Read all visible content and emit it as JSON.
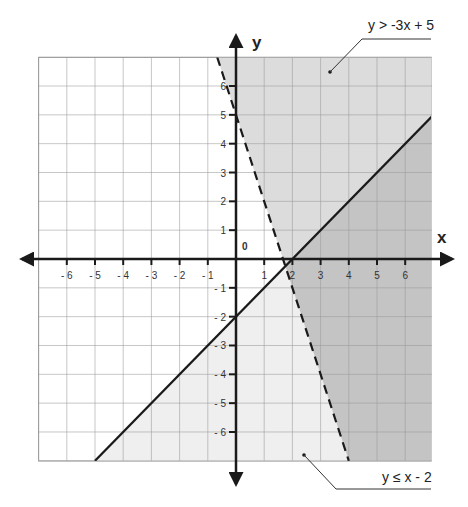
{
  "chart_data": {
    "type": "inequality-graph",
    "title": "",
    "xlabel": "x",
    "ylabel": "y",
    "origin_label": "0",
    "xlim": [
      -7,
      6.95
    ],
    "ylim": [
      -7,
      7
    ],
    "grid": true,
    "x_ticks": [
      -6,
      -5,
      -4,
      -3,
      -2,
      -1,
      1,
      2,
      3,
      4,
      5,
      6
    ],
    "x_tick_labels": [
      "- 6",
      "- 5",
      "- 4",
      "- 3",
      "- 2",
      "- 1",
      "1",
      "2",
      "3",
      "4",
      "5",
      "6"
    ],
    "y_ticks": [
      6,
      5,
      4,
      3,
      2,
      1,
      -1,
      -2,
      -3,
      -4,
      -5,
      -6
    ],
    "y_tick_labels": [
      "6",
      "5",
      "4",
      "3",
      "2",
      "1",
      "- 1",
      "- 2",
      "- 3",
      "- 4",
      "- 5",
      "- 6"
    ],
    "inequalities": [
      {
        "label": "y > -3x + 5",
        "slope": -3,
        "intercept": 5,
        "boundary": "dashed",
        "shade": "above",
        "points": [
          [
            -0.667,
            7
          ],
          [
            4,
            -7
          ]
        ]
      },
      {
        "label": "y ≤ x - 2",
        "slope": 1,
        "intercept": -2,
        "boundary": "solid",
        "shade": "below",
        "points": [
          [
            -5,
            -7
          ],
          [
            6.95,
            4.95
          ]
        ]
      }
    ],
    "intersection": [
      1.75,
      -0.25
    ],
    "colors": {
      "light_region": "#efefef",
      "medium_region": "#dcdcdc",
      "overlap_region": "#c4c4c4",
      "grid": "#9a9a9a",
      "axis": "#1a1a1a",
      "boundary": "#1a1a1a"
    }
  }
}
